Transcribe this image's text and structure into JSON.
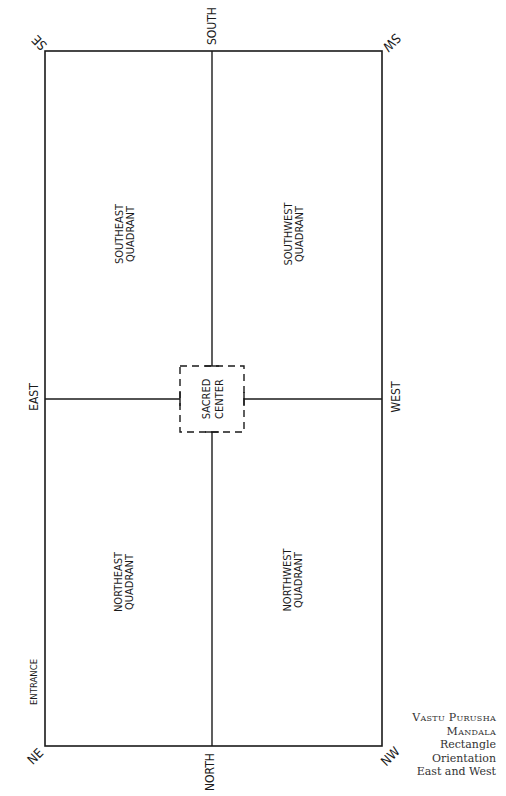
{
  "diagram": {
    "corners": {
      "se": "SE",
      "sw": "SW",
      "ne": "NE",
      "nw": "NW"
    },
    "directions": {
      "south": "SOUTH",
      "north": "NORTH",
      "east": "EAST",
      "west": "WEST"
    },
    "quadrants": {
      "southeast": [
        "SOUTHEAST",
        "QUADRANT"
      ],
      "southwest": [
        "SOUTHWEST",
        "QUADRANT"
      ],
      "northeast": [
        "NORTHEAST",
        "QUADRANT"
      ],
      "northwest": [
        "NORTHWEST",
        "QUADRANT"
      ]
    },
    "center": [
      "SACRED",
      "CENTER"
    ],
    "entrance": "ENTRANCE"
  },
  "caption": {
    "line1": "Vastu Purusha",
    "line2": "Mandala",
    "line3": "Rectangle",
    "line4": "Orientation",
    "line5": "East and West"
  }
}
